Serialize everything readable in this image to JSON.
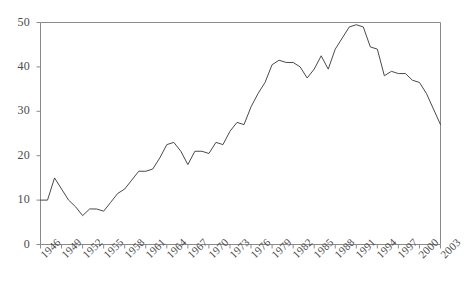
{
  "chart_data": {
    "type": "line",
    "title": "",
    "subtitle": "",
    "xlabel": "",
    "ylabel": "",
    "grid": false,
    "legend": false,
    "legend_position": "none",
    "xlim": [
      1946,
      2003
    ],
    "ylim": [
      0,
      50
    ],
    "yticks": [
      0,
      10,
      20,
      30,
      40,
      50
    ],
    "ytick_labels": [
      "0",
      "10",
      "20",
      "30",
      "40",
      "50"
    ],
    "xticks": [
      1946,
      1949,
      1952,
      1955,
      1958,
      1961,
      1964,
      1967,
      1970,
      1973,
      1976,
      1979,
      1982,
      1985,
      1988,
      1991,
      1994,
      1997,
      2000,
      2003
    ],
    "xtick_labels": [
      "1946",
      "1949",
      "1952",
      "1955",
      "1958",
      "1961",
      "1964",
      "1967",
      "1970",
      "1973",
      "1976",
      "1979",
      "1982",
      "1985",
      "1988",
      "1991",
      "1994",
      "1997",
      "2000",
      "2003"
    ],
    "xtick_rotation": -45,
    "line_color": "#4a4a4a",
    "line_width": 1,
    "axis_color": "#8a8a8a",
    "background": "#ffffff",
    "x": [
      1946,
      1947,
      1948,
      1949,
      1950,
      1951,
      1952,
      1953,
      1954,
      1955,
      1956,
      1957,
      1958,
      1959,
      1960,
      1961,
      1962,
      1963,
      1964,
      1965,
      1966,
      1967,
      1968,
      1969,
      1970,
      1971,
      1972,
      1973,
      1974,
      1975,
      1976,
      1977,
      1978,
      1979,
      1980,
      1981,
      1982,
      1983,
      1984,
      1985,
      1986,
      1987,
      1988,
      1989,
      1990,
      1991,
      1992,
      1993,
      1994,
      1995,
      1996,
      1997,
      1998,
      1999,
      2000,
      2001,
      2002,
      2003
    ],
    "y": [
      10.0,
      10.0,
      15.0,
      12.5,
      10.0,
      8.5,
      6.5,
      8.0,
      8.0,
      7.5,
      9.5,
      11.5,
      12.5,
      14.5,
      16.5,
      16.5,
      17.0,
      19.5,
      22.5,
      23.0,
      21.0,
      18.0,
      21.0,
      21.0,
      20.5,
      23.0,
      22.5,
      25.5,
      27.5,
      27.0,
      31.0,
      34.0,
      36.5,
      40.5,
      41.5,
      41.0,
      41.0,
      40.0,
      37.5,
      39.5,
      42.5,
      39.5,
      44.0,
      46.5,
      49.0,
      49.5,
      49.0,
      44.5,
      44.0,
      38.0,
      39.0,
      38.5,
      38.5,
      37.0,
      36.5,
      34.0,
      30.5,
      27.0
    ],
    "series_name": "value"
  }
}
